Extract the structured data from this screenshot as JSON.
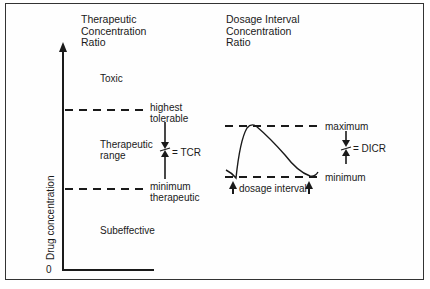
{
  "diagram": {
    "left_panel": {
      "title_lines": [
        "Therapeutic",
        "Concentration",
        "Ratio"
      ],
      "y_axis_label": "Drug concentration",
      "origin_label": "0",
      "zones": {
        "toxic": "Toxic",
        "therapeutic_range_lines": [
          "Therapeutic",
          "range"
        ],
        "subeffective": "Subeffective"
      },
      "upper_line_label_lines": [
        "highest",
        "tolerable"
      ],
      "lower_line_label_lines": [
        "minimum",
        "therapeutic"
      ],
      "ratio_label": "= TCR"
    },
    "right_panel": {
      "title_lines": [
        "Dosage Interval",
        "Concentration",
        "Ratio"
      ],
      "max_label": "maximum",
      "min_label": "minimum",
      "interval_label": "dosage interval",
      "ratio_label": "= DICR"
    },
    "colors": {
      "ink": "#1a1a1a",
      "border": "#333333",
      "background": "#ffffff"
    }
  }
}
